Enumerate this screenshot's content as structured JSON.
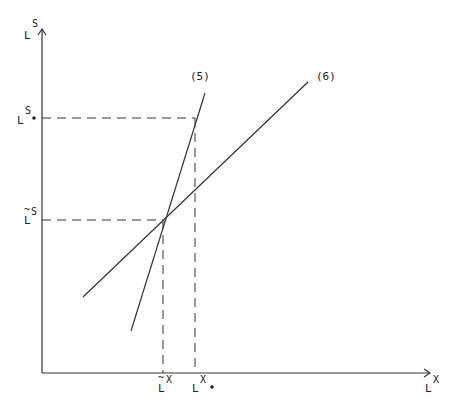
{
  "diagram": {
    "type": "two-line intersection diagram",
    "axes": {
      "x_label": {
        "base": "L",
        "sup": "X"
      },
      "y_label": {
        "base": "L",
        "sup": "S"
      }
    },
    "lines": [
      {
        "id": "5",
        "label": "(5)",
        "description": "steeper line"
      },
      {
        "id": "6",
        "label": "(6)",
        "description": "flatter line"
      }
    ],
    "points": {
      "intersection": {
        "x_label": {
          "base": "L",
          "sup": "X",
          "accent": "~"
        },
        "y_label": {
          "base": "L",
          "sup": "S",
          "accent": "~"
        }
      },
      "upper": {
        "x_label": {
          "base": "L",
          "sup": "X",
          "marker": "•"
        },
        "y_label": {
          "base": "L",
          "sup": "S",
          "marker": "•"
        }
      }
    },
    "color": "#222222"
  }
}
